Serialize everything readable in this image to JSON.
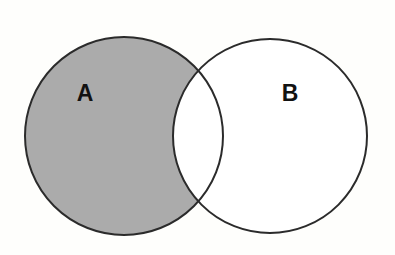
{
  "diagram": {
    "kind": "venn-diagram",
    "background_color": "#fefefc",
    "shaded_region": "A-only (A minus B)",
    "stroke_color": "#2b2b2b",
    "shade_color": "#ababab",
    "unshaded_color": "#ffffff",
    "stroke_width": 2,
    "sets": [
      {
        "id": "A",
        "label": "A",
        "fill": "#ababab",
        "filled": true,
        "cx": 124,
        "cy": 136,
        "r": 99,
        "label_x": 85,
        "label_y": 95
      },
      {
        "id": "B",
        "label": "B",
        "fill": "#ffffff",
        "filled": false,
        "cx": 270,
        "cy": 136,
        "r": 97,
        "label_x": 290,
        "label_y": 95
      }
    ],
    "regions": [
      {
        "id": "a-only",
        "name": "A only",
        "shaded": true,
        "fill": "#ababab"
      },
      {
        "id": "intersection",
        "name": "A intersect B",
        "shaded": false,
        "fill": "#ffffff"
      },
      {
        "id": "b-only",
        "name": "B only",
        "shaded": false,
        "fill": "#ffffff"
      }
    ]
  },
  "chart_data": {
    "type": "diagram",
    "subtype": "venn",
    "sets": [
      "A",
      "B"
    ],
    "set_labels": [
      "A",
      "B"
    ],
    "shaded_regions": [
      "A"
    ],
    "unshaded_regions": [
      "A∩B",
      "B"
    ],
    "geometry": {
      "circle_A": {
        "cx": 124,
        "cy": 136,
        "r": 99
      },
      "circle_B": {
        "cx": 270,
        "cy": 136,
        "r": 97
      },
      "canvas": {
        "width": 395,
        "height": 255
      }
    },
    "colors": {
      "shade": "#ababab",
      "stroke": "#2b2b2b",
      "background": "#fefefc"
    }
  }
}
